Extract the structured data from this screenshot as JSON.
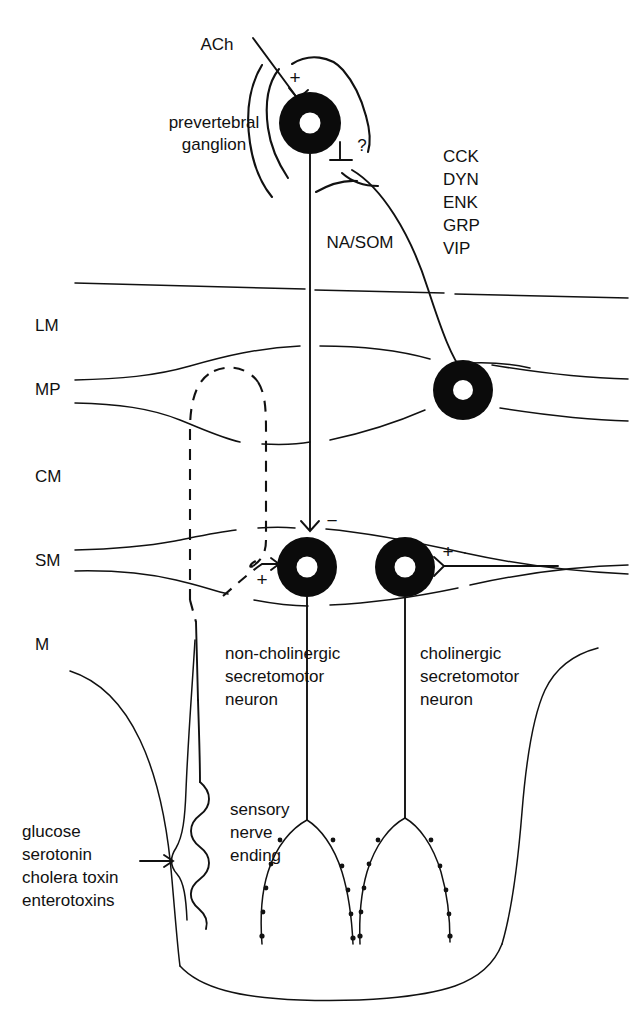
{
  "figure": {
    "background_color": "#ffffff",
    "ink_color": "#111111",
    "width": 632,
    "height": 1023
  },
  "ganglion": {
    "input_transmitter_label": "ACh",
    "input_sign": "+",
    "name_line1": "prevertebral",
    "name_line2": "ganglion",
    "unknown_input_sign": "⊥",
    "unknown_marker": "?",
    "output_transmitter_label": "NA/SOM"
  },
  "peptide_list": {
    "items": [
      "CCK",
      "DYN",
      "ENK",
      "GRP",
      "VIP"
    ]
  },
  "layers": [
    {
      "abbrev": "LM",
      "name": "longitudinal muscle"
    },
    {
      "abbrev": "MP",
      "name": "myenteric plexus"
    },
    {
      "abbrev": "CM",
      "name": "circular muscle"
    },
    {
      "abbrev": "SM",
      "name": "submucous plexus"
    },
    {
      "abbrev": "M",
      "name": "mucosa"
    }
  ],
  "synapses": {
    "ganglion_excitatory": "+",
    "ganglion_unknown": "?",
    "noncholinergic_inhibitory": "−",
    "noncholinergic_excitatory": "+",
    "cholinergic_excitatory": "+"
  },
  "neurons": {
    "noncholinergic": {
      "line1": "non-cholinergic",
      "line2": "secretomotor",
      "line3": "neuron"
    },
    "cholinergic": {
      "line1": "cholinergic",
      "line2": "secretomotor",
      "line3": "neuron"
    }
  },
  "sensory": {
    "line1": "sensory",
    "line2": "nerve",
    "line3": "ending"
  },
  "stimuli": {
    "items": [
      "glucose",
      "serotonin",
      "cholera toxin",
      "enterotoxins"
    ],
    "arrow": "→"
  }
}
